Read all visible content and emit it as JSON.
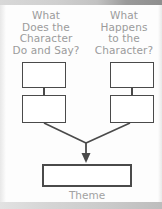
{
  "diagram": {
    "title_left": "What\nDoes the\nCharacter\nDo and Say?",
    "title_right": "What\nHappens\nto the\nCharacter?",
    "theme_label": "Theme",
    "boxes": [
      {
        "id": "left-upper",
        "text": ""
      },
      {
        "id": "left-lower",
        "text": ""
      },
      {
        "id": "right-upper",
        "text": ""
      },
      {
        "id": "right-lower",
        "text": ""
      },
      {
        "id": "theme",
        "text": ""
      }
    ],
    "colors": {
      "box_border": "#4a4a4a",
      "text": "#9b9b9b",
      "theme_text": "#a2a2a2",
      "background": "#fdfdfd",
      "arrow": "#4a4a4a"
    },
    "arrows": [
      {
        "id": "left-branch",
        "from": "left-lower",
        "to": "merge-point"
      },
      {
        "id": "right-branch",
        "from": "right-lower",
        "to": "merge-point"
      },
      {
        "id": "merge-to-theme",
        "from": "merge-point",
        "to": "theme",
        "arrowhead": true
      }
    ]
  }
}
